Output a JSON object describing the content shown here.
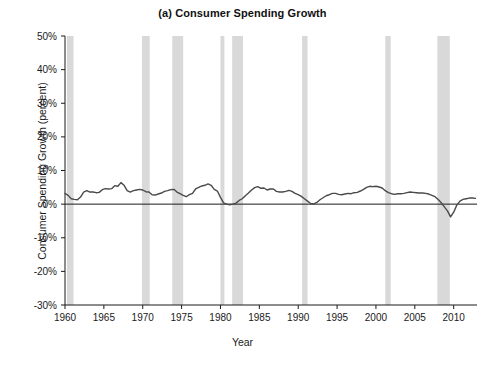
{
  "chart_data": {
    "type": "line",
    "title": "(a) Consumer Spending Growth",
    "xlabel": "Year",
    "ylabel": "Consumer Spending Growth (percent)",
    "xlim": [
      1960,
      2013
    ],
    "ylim": [
      -30,
      50
    ],
    "ytick_labels": [
      "50%",
      "40%",
      "30%",
      "20%",
      "10%",
      "0%",
      "-10%",
      "-20%",
      "-30%"
    ],
    "ytick_values": [
      50,
      40,
      30,
      20,
      10,
      0,
      -10,
      -20,
      -30
    ],
    "xtick_labels": [
      "1960",
      "1965",
      "1970",
      "1975",
      "1980",
      "1985",
      "1990",
      "1995",
      "2000",
      "2005",
      "2010"
    ],
    "xtick_values": [
      1960,
      1965,
      1970,
      1975,
      1980,
      1985,
      1990,
      1995,
      2000,
      2005,
      2010
    ],
    "grid": false,
    "legend": "none",
    "line_color": "#4a4a4a",
    "axis_color": "#1a1a1a",
    "recession_band_color": "#d9d9d9",
    "recession_bands": [
      {
        "start": 1960.25,
        "end": 1961.1
      },
      {
        "start": 1969.9,
        "end": 1970.9
      },
      {
        "start": 1973.8,
        "end": 1975.2
      },
      {
        "start": 1980.0,
        "end": 1980.5
      },
      {
        "start": 1981.5,
        "end": 1982.9
      },
      {
        "start": 1990.5,
        "end": 1991.2
      },
      {
        "start": 2001.2,
        "end": 2001.9
      },
      {
        "start": 2007.9,
        "end": 2009.5
      }
    ],
    "series": [
      {
        "name": "Consumer Spending Growth",
        "x": [
          1960.0,
          1960.4,
          1960.8,
          1961.2,
          1961.6,
          1962.0,
          1962.4,
          1962.8,
          1963.2,
          1963.6,
          1964.0,
          1964.4,
          1964.8,
          1965.2,
          1965.6,
          1966.0,
          1966.4,
          1966.8,
          1967.2,
          1967.6,
          1968.0,
          1968.4,
          1968.8,
          1969.2,
          1969.6,
          1970.0,
          1970.4,
          1970.8,
          1971.2,
          1971.6,
          1972.0,
          1972.4,
          1972.8,
          1973.2,
          1973.6,
          1974.0,
          1974.4,
          1974.8,
          1975.2,
          1975.6,
          1976.0,
          1976.4,
          1976.8,
          1977.2,
          1977.6,
          1978.0,
          1978.4,
          1978.8,
          1979.2,
          1979.6,
          1980.0,
          1980.4,
          1980.8,
          1981.2,
          1981.6,
          1982.0,
          1982.4,
          1982.8,
          1983.2,
          1983.6,
          1984.0,
          1984.4,
          1984.8,
          1985.2,
          1985.6,
          1986.0,
          1986.4,
          1986.8,
          1987.2,
          1987.6,
          1988.0,
          1988.4,
          1988.8,
          1989.2,
          1989.6,
          1990.0,
          1990.4,
          1990.8,
          1991.2,
          1991.6,
          1992.0,
          1992.4,
          1992.8,
          1993.2,
          1993.6,
          1994.0,
          1994.4,
          1994.8,
          1995.2,
          1995.6,
          1996.0,
          1996.4,
          1996.8,
          1997.2,
          1997.6,
          1998.0,
          1998.4,
          1998.8,
          1999.2,
          1999.6,
          2000.0,
          2000.4,
          2000.8,
          2001.2,
          2001.6,
          2002.0,
          2002.4,
          2002.8,
          2003.2,
          2003.6,
          2004.0,
          2004.4,
          2004.8,
          2005.2,
          2005.6,
          2006.0,
          2006.4,
          2006.8,
          2007.2,
          2007.6,
          2008.0,
          2008.4,
          2008.8,
          2009.2,
          2009.6,
          2010.0,
          2010.4,
          2010.8,
          2011.2,
          2011.6,
          2012.0,
          2012.4,
          2012.8
        ],
        "values": [
          3.2,
          2.6,
          1.6,
          1.4,
          1.3,
          2.1,
          3.6,
          4.0,
          3.6,
          3.6,
          3.4,
          3.5,
          4.3,
          4.6,
          4.5,
          4.6,
          5.5,
          5.3,
          6.4,
          5.6,
          4.0,
          3.6,
          4.0,
          4.2,
          4.4,
          4.2,
          3.7,
          3.6,
          2.8,
          2.7,
          3.0,
          3.3,
          3.8,
          4.0,
          4.3,
          4.4,
          3.6,
          3.1,
          2.6,
          2.2,
          2.8,
          3.2,
          4.5,
          5.0,
          5.4,
          5.6,
          6.0,
          5.6,
          4.4,
          3.9,
          2.0,
          0.4,
          0.0,
          -0.2,
          0.0,
          0.3,
          1.1,
          1.6,
          2.5,
          3.3,
          4.2,
          4.9,
          5.2,
          4.7,
          4.8,
          4.2,
          4.5,
          4.5,
          3.8,
          3.6,
          3.6,
          3.8,
          4.1,
          3.8,
          3.2,
          2.8,
          2.3,
          1.6,
          0.9,
          0.2,
          0.1,
          0.5,
          1.3,
          1.9,
          2.5,
          2.8,
          3.2,
          3.2,
          2.9,
          2.8,
          3.0,
          3.2,
          3.1,
          3.4,
          3.5,
          3.9,
          4.4,
          5.0,
          5.3,
          5.2,
          5.3,
          5.1,
          4.8,
          4.0,
          3.4,
          3.1,
          2.9,
          3.1,
          3.1,
          3.2,
          3.4,
          3.6,
          3.5,
          3.4,
          3.3,
          3.3,
          3.2,
          3.0,
          2.6,
          2.2,
          1.4,
          0.4,
          -0.8,
          -2.0,
          -3.8,
          -2.4,
          -0.3,
          0.9,
          1.4,
          1.6,
          1.8,
          1.8,
          1.7
        ]
      }
    ]
  },
  "figure": {
    "title": "(a) Consumer Spending Growth",
    "x_axis_label": "Year",
    "y_axis_label": "Consumer Spending Growth (percent)"
  }
}
